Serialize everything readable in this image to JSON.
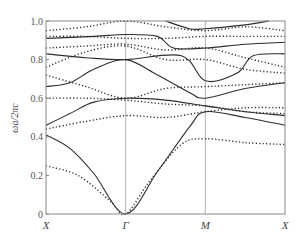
{
  "chart_data": {
    "type": "line",
    "title": "",
    "xlabel": "",
    "ylabel": "ωa/2πc",
    "ylim": [
      0,
      1.0
    ],
    "yticks": [
      "0",
      "0.2",
      "0.4",
      "0.6",
      "0.8",
      "1.0"
    ],
    "ytick_values": [
      0,
      0.2,
      0.4,
      0.6,
      0.8,
      1.0
    ],
    "x_symmetry_points": [
      "X",
      "Γ",
      "M",
      "X"
    ],
    "x_positions": [
      0,
      1,
      2,
      3
    ],
    "grid": false,
    "vertical_lines_at": [
      1,
      2
    ],
    "legend": null,
    "series": [
      {
        "name": "solid-1",
        "style": "solid",
        "points": [
          [
            0,
            0.41
          ],
          [
            0.3,
            0.34
          ],
          [
            0.6,
            0.21
          ],
          [
            1,
            0.0
          ],
          [
            1.4,
            0.22
          ],
          [
            1.8,
            0.45
          ],
          [
            2,
            0.53
          ],
          [
            2.5,
            0.5
          ],
          [
            3,
            0.46
          ]
        ]
      },
      {
        "name": "solid-2",
        "style": "solid",
        "points": [
          [
            0,
            0.46
          ],
          [
            0.3,
            0.52
          ],
          [
            0.6,
            0.58
          ],
          [
            1,
            0.6
          ],
          [
            1.5,
            0.59
          ],
          [
            2,
            0.56
          ],
          [
            2.5,
            0.53
          ],
          [
            3,
            0.51
          ]
        ]
      },
      {
        "name": "solid-3",
        "style": "solid",
        "points": [
          [
            0,
            0.66
          ],
          [
            0.3,
            0.68
          ],
          [
            0.6,
            0.75
          ],
          [
            1,
            0.8
          ],
          [
            1.4,
            0.72
          ],
          [
            1.8,
            0.63
          ],
          [
            2,
            0.6
          ],
          [
            2.5,
            0.65
          ],
          [
            3,
            0.68
          ]
        ]
      },
      {
        "name": "solid-4",
        "style": "solid",
        "points": [
          [
            0,
            0.83
          ],
          [
            0.5,
            0.81
          ],
          [
            1,
            0.8
          ],
          [
            1.7,
            0.82
          ],
          [
            2,
            0.69
          ],
          [
            2.4,
            0.73
          ],
          [
            2.6,
            0.82
          ],
          [
            3,
            0.83
          ]
        ]
      },
      {
        "name": "solid-5",
        "style": "solid",
        "points": [
          [
            0,
            0.91
          ],
          [
            0.6,
            0.92
          ],
          [
            1,
            0.93
          ],
          [
            1.4,
            0.92
          ],
          [
            1.6,
            0.86
          ],
          [
            2,
            0.86
          ],
          [
            2.5,
            0.88
          ],
          [
            3,
            0.89
          ]
        ]
      },
      {
        "name": "solid-6",
        "style": "solid",
        "points": [
          [
            1.5,
            1.0
          ],
          [
            1.8,
            0.96
          ],
          [
            2,
            0.96
          ],
          [
            2.5,
            0.98
          ],
          [
            2.8,
            1.0
          ]
        ]
      },
      {
        "name": "dotted-1",
        "style": "dotted",
        "points": [
          [
            0,
            0.25
          ],
          [
            0.4,
            0.2
          ],
          [
            0.8,
            0.07
          ],
          [
            1,
            0.0
          ],
          [
            1.3,
            0.17
          ],
          [
            1.7,
            0.36
          ],
          [
            2,
            0.39
          ],
          [
            2.5,
            0.37
          ],
          [
            3,
            0.36
          ]
        ]
      },
      {
        "name": "dotted-2",
        "style": "dotted",
        "points": [
          [
            0,
            0.44
          ],
          [
            0.5,
            0.48
          ],
          [
            1,
            0.51
          ],
          [
            1.5,
            0.5
          ],
          [
            2,
            0.53
          ],
          [
            2.5,
            0.55
          ],
          [
            3,
            0.55
          ]
        ]
      },
      {
        "name": "dotted-3",
        "style": "dotted",
        "points": [
          [
            0,
            0.6
          ],
          [
            0.5,
            0.6
          ],
          [
            1,
            0.59
          ],
          [
            1.5,
            0.57
          ],
          [
            2,
            0.56
          ],
          [
            2.5,
            0.53
          ],
          [
            3,
            0.52
          ]
        ]
      },
      {
        "name": "dotted-4",
        "style": "dotted",
        "points": [
          [
            0,
            0.72
          ],
          [
            0.5,
            0.66
          ],
          [
            1,
            0.6
          ],
          [
            1.5,
            0.65
          ],
          [
            2,
            0.66
          ],
          [
            2.5,
            0.67
          ],
          [
            3,
            0.68
          ]
        ]
      },
      {
        "name": "dotted-5",
        "style": "dotted",
        "points": [
          [
            0,
            0.76
          ],
          [
            0.5,
            0.84
          ],
          [
            1,
            0.87
          ],
          [
            1.5,
            0.8
          ],
          [
            2,
            0.8
          ],
          [
            2.5,
            0.75
          ],
          [
            3,
            0.73
          ]
        ]
      },
      {
        "name": "dotted-6",
        "style": "dotted",
        "points": [
          [
            0,
            0.86
          ],
          [
            0.5,
            0.87
          ],
          [
            1,
            0.88
          ],
          [
            1.5,
            0.85
          ],
          [
            2,
            0.86
          ],
          [
            2.5,
            0.81
          ],
          [
            3,
            0.76
          ]
        ]
      },
      {
        "name": "dotted-7",
        "style": "dotted",
        "points": [
          [
            0,
            0.92
          ],
          [
            0.5,
            0.92
          ],
          [
            1,
            0.91
          ],
          [
            1.5,
            0.91
          ],
          [
            2,
            0.92
          ],
          [
            2.5,
            0.92
          ],
          [
            3,
            0.92
          ]
        ]
      },
      {
        "name": "dotted-8",
        "style": "dotted",
        "points": [
          [
            0,
            0.95
          ],
          [
            0.5,
            0.97
          ],
          [
            1,
            1.0
          ],
          [
            1.5,
            0.97
          ],
          [
            2,
            0.95
          ],
          [
            2.5,
            0.97
          ],
          [
            3,
            0.95
          ]
        ]
      }
    ]
  }
}
